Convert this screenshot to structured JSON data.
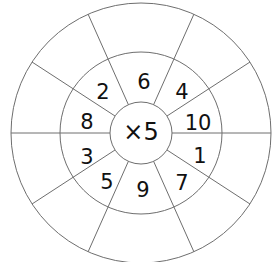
{
  "wheel": {
    "center_label": "×5",
    "multiplier": 5,
    "operation": "×",
    "inner_numbers": [
      {
        "value": "6",
        "position": "top"
      },
      {
        "value": "4",
        "position": "top-right"
      },
      {
        "value": "10",
        "position": "right-upper"
      },
      {
        "value": "1",
        "position": "right-lower"
      },
      {
        "value": "7",
        "position": "bottom-right"
      },
      {
        "value": "9",
        "position": "bottom"
      },
      {
        "value": "5",
        "position": "bottom-left"
      },
      {
        "value": "3",
        "position": "left-lower"
      },
      {
        "value": "8",
        "position": "left-upper"
      },
      {
        "value": "2",
        "position": "top-left"
      }
    ],
    "outer_answers": [
      "",
      "",
      "",
      "",
      "",
      "",
      "",
      "",
      "",
      ""
    ],
    "segment_count": 10
  },
  "colors": {
    "lines": "#6e6e6e",
    "text": "#111111",
    "background": "#ffffff"
  }
}
